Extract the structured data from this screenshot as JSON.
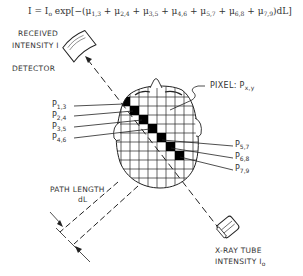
{
  "equation": {
    "lhs": "I = I",
    "lhs_sub": "o",
    "body": " exp[−(",
    "terms": [
      {
        "sym": "μ",
        "sub": "1,3"
      },
      {
        "sym": "μ",
        "sub": "2,4"
      },
      {
        "sym": "μ",
        "sub": "3,5"
      },
      {
        "sym": "μ",
        "sub": "4,6"
      },
      {
        "sym": "μ",
        "sub": "5,7"
      },
      {
        "sym": "μ",
        "sub": "6,8"
      },
      {
        "sym": "μ",
        "sub": "7,9"
      }
    ],
    "tail": ")dL]"
  },
  "labels": {
    "received": "RECEIVED",
    "intensity_i": "INTENSITY I",
    "detector": "DETECTOR",
    "pixel": "PIXEL:  P",
    "pixel_sub": "x,y",
    "path_length": "PATH LENGTH",
    "dl": "dL",
    "xray_tube": "X-RAY TUBE",
    "intensity_io": "INTENSITY I",
    "intensity_io_sub": "o"
  },
  "pixel_labels_left": [
    {
      "p": "P",
      "sub": "1,3"
    },
    {
      "p": "P",
      "sub": "2,4"
    },
    {
      "p": "P",
      "sub": "3,5"
    },
    {
      "p": "P",
      "sub": "4,6"
    }
  ],
  "pixel_labels_right": [
    {
      "p": "P",
      "sub": "5,7"
    },
    {
      "p": "P",
      "sub": "6,8"
    },
    {
      "p": "P",
      "sub": "7,9"
    }
  ],
  "colors": {
    "line": "#222222",
    "fill_pixel": "#000000",
    "text": "#333333"
  }
}
